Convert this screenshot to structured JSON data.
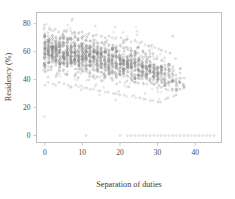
{
  "chart_data": {
    "type": "scatter",
    "title": "",
    "xlabel": "Separation of duties",
    "ylabel": "Residency (%)",
    "xlim": [
      -2.2,
      47
    ],
    "ylim": [
      -5,
      88
    ],
    "xticks": [
      0,
      10,
      20,
      30,
      40
    ],
    "yticks": [
      0,
      20,
      40,
      60,
      80
    ],
    "xtick_labels": [
      "0",
      "10",
      "20",
      "30",
      "40"
    ],
    "ytick_labels": [
      "0",
      "20",
      "40",
      "60",
      "80"
    ],
    "grid": false,
    "legend": null,
    "marker": "circle-open",
    "marker_color": "#8c8c8c",
    "frame_color": "#b9b9b9",
    "columns": [
      {
        "x": 0,
        "count": 46,
        "low": 43,
        "high": 72,
        "median": 60,
        "outliers": [
          77,
          79,
          36
        ]
      },
      {
        "x": 1,
        "count": 44,
        "low": 44,
        "high": 71,
        "median": 60,
        "outliers": [
          76,
          38
        ]
      },
      {
        "x": 2,
        "count": 45,
        "low": 43,
        "high": 71,
        "median": 59,
        "outliers": [
          75,
          37
        ]
      },
      {
        "x": 3,
        "count": 44,
        "low": 43,
        "high": 70,
        "median": 59,
        "outliers": [
          76,
          36
        ]
      },
      {
        "x": 4,
        "count": 43,
        "low": 43,
        "high": 70,
        "median": 59,
        "outliers": [
          74,
          38
        ]
      },
      {
        "x": 5,
        "count": 43,
        "low": 43,
        "high": 70,
        "median": 58,
        "outliers": [
          75,
          37
        ]
      },
      {
        "x": 6,
        "count": 42,
        "low": 42,
        "high": 69,
        "median": 58,
        "outliers": [
          74,
          36
        ]
      },
      {
        "x": 7,
        "count": 42,
        "low": 42,
        "high": 69,
        "median": 58,
        "outliers": [
          73,
          35
        ]
      },
      {
        "x": 8,
        "count": 41,
        "low": 42,
        "high": 69,
        "median": 57,
        "outliers": [
          74,
          36
        ]
      },
      {
        "x": 9,
        "count": 41,
        "low": 41,
        "high": 68,
        "median": 57,
        "outliers": [
          73,
          35
        ]
      },
      {
        "x": 10,
        "count": 40,
        "low": 41,
        "high": 68,
        "median": 57,
        "outliers": [
          74,
          34
        ]
      },
      {
        "x": 11,
        "count": 40,
        "low": 41,
        "high": 68,
        "median": 56,
        "outliers": [
          72,
          34
        ]
      },
      {
        "x": 12,
        "count": 39,
        "low": 40,
        "high": 67,
        "median": 56,
        "outliers": [
          73,
          33
        ]
      },
      {
        "x": 13,
        "count": 39,
        "low": 40,
        "high": 67,
        "median": 56,
        "outliers": [
          71,
          33
        ]
      },
      {
        "x": 14,
        "count": 38,
        "low": 40,
        "high": 67,
        "median": 55,
        "outliers": [
          72,
          32
        ]
      },
      {
        "x": 15,
        "count": 38,
        "low": 39,
        "high": 66,
        "median": 55,
        "outliers": [
          71,
          32
        ]
      },
      {
        "x": 16,
        "count": 37,
        "low": 39,
        "high": 66,
        "median": 55,
        "outliers": [
          70,
          31
        ]
      },
      {
        "x": 17,
        "count": 37,
        "low": 39,
        "high": 65,
        "median": 54,
        "outliers": [
          71,
          31
        ]
      },
      {
        "x": 18,
        "count": 36,
        "low": 38,
        "high": 65,
        "median": 54,
        "outliers": [
          70,
          30
        ]
      },
      {
        "x": 19,
        "count": 36,
        "low": 38,
        "high": 64,
        "median": 53,
        "outliers": [
          69,
          30
        ]
      },
      {
        "x": 20,
        "count": 35,
        "low": 38,
        "high": 64,
        "median": 53,
        "outliers": [
          70,
          29
        ]
      },
      {
        "x": 21,
        "count": 35,
        "low": 37,
        "high": 63,
        "median": 52,
        "outliers": [
          68,
          29
        ]
      },
      {
        "x": 22,
        "count": 34,
        "low": 37,
        "high": 63,
        "median": 52,
        "outliers": [
          69,
          28
        ]
      },
      {
        "x": 23,
        "count": 34,
        "low": 36,
        "high": 62,
        "median": 51,
        "outliers": [
          67,
          28
        ]
      },
      {
        "x": 24,
        "count": 33,
        "low": 36,
        "high": 62,
        "median": 51,
        "outliers": [
          68,
          27
        ]
      },
      {
        "x": 25,
        "count": 32,
        "low": 35,
        "high": 61,
        "median": 50,
        "outliers": [
          66,
          27
        ]
      },
      {
        "x": 26,
        "count": 31,
        "low": 35,
        "high": 60,
        "median": 49,
        "outliers": [
          67,
          26
        ]
      },
      {
        "x": 27,
        "count": 30,
        "low": 34,
        "high": 59,
        "median": 48,
        "outliers": [
          65,
          26
        ]
      },
      {
        "x": 28,
        "count": 29,
        "low": 34,
        "high": 58,
        "median": 47,
        "outliers": [
          64,
          25
        ]
      },
      {
        "x": 29,
        "count": 27,
        "low": 33,
        "high": 57,
        "median": 46,
        "outliers": [
          63,
          25
        ]
      },
      {
        "x": 30,
        "count": 25,
        "low": 33,
        "high": 56,
        "median": 45,
        "outliers": [
          62,
          24
        ]
      },
      {
        "x": 31,
        "count": 23,
        "low": 32,
        "high": 55,
        "median": 44,
        "outliers": [
          61,
          24
        ]
      },
      {
        "x": 32,
        "count": 20,
        "low": 32,
        "high": 54,
        "median": 43,
        "outliers": [
          60,
          26
        ]
      },
      {
        "x": 33,
        "count": 17,
        "low": 31,
        "high": 53,
        "median": 42,
        "outliers": [
          59,
          27
        ]
      },
      {
        "x": 34,
        "count": 14,
        "low": 31,
        "high": 52,
        "median": 41,
        "outliers": [
          71,
          28
        ]
      },
      {
        "x": 35,
        "count": 11,
        "low": 30,
        "high": 50,
        "median": 40,
        "outliers": [
          55,
          29
        ]
      },
      {
        "x": 36,
        "count": 7,
        "low": 32,
        "high": 46,
        "median": 39,
        "outliers": [
          48
        ]
      },
      {
        "x": 37,
        "count": 4,
        "low": 34,
        "high": 44,
        "median": 38,
        "outliers": [
          41
        ]
      }
    ],
    "zero_row": {
      "y": 0,
      "x_values": [
        11,
        20,
        22,
        23,
        24,
        25,
        26,
        27,
        28,
        29,
        30,
        31,
        32,
        33,
        34,
        35,
        36,
        37,
        38,
        39,
        40,
        41,
        42,
        43,
        44,
        45
      ]
    }
  }
}
